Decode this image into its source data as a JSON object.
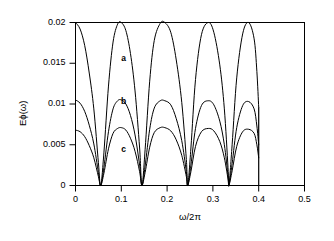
{
  "chart_data": {
    "type": "line",
    "title": "",
    "subtitle": "",
    "xlabel": "ω/2π",
    "ylabel": "Eₖ(ω)",
    "ylabel_text": "Eϕ(ω)",
    "xlim": [
      0,
      0.5
    ],
    "ylim": [
      0,
      0.02
    ],
    "grid": false,
    "legend_position": "inline-annotations",
    "xticks": [
      0,
      0.1,
      0.2,
      0.3,
      0.4,
      0.5
    ],
    "xticklabels": [
      "0",
      "0.1",
      "0.2",
      "0.3",
      "0.4",
      "0.5"
    ],
    "yticks": [
      0,
      0.005,
      0.01,
      0.015,
      0.02
    ],
    "yticklabels": [
      "0",
      "0.005",
      "0.01",
      "0.015",
      "0.02"
    ],
    "zeros": [
      0.055,
      0.145,
      0.245,
      0.335
    ],
    "cutoff_x": 0.4,
    "annotations": [
      {
        "text": "a",
        "x": 0.105,
        "y": 0.0155
      },
      {
        "text": "b",
        "x": 0.105,
        "y": 0.0103
      },
      {
        "text": "c",
        "x": 0.105,
        "y": 0.0043
      }
    ],
    "series": [
      {
        "name": "a",
        "peak_value": 0.02,
        "start_value": 0.02,
        "peaks_x": [
          0.0,
          0.1,
          0.195,
          0.29,
          0.378
        ],
        "peaks_y": [
          0.02,
          0.02,
          0.02,
          0.02,
          0.02
        ],
        "x": [
          0.0,
          0.01,
          0.02,
          0.03,
          0.04,
          0.05,
          0.055,
          0.062,
          0.072,
          0.082,
          0.092,
          0.1,
          0.11,
          0.12,
          0.13,
          0.14,
          0.145,
          0.152,
          0.162,
          0.172,
          0.185,
          0.195,
          0.208,
          0.22,
          0.232,
          0.242,
          0.245,
          0.252,
          0.262,
          0.275,
          0.29,
          0.302,
          0.315,
          0.325,
          0.333,
          0.335,
          0.342,
          0.352,
          0.365,
          0.378,
          0.39,
          0.396,
          0.4
        ],
        "y": [
          0.02,
          0.0192,
          0.0172,
          0.0138,
          0.0094,
          0.0028,
          0.0,
          0.004,
          0.0122,
          0.0176,
          0.0198,
          0.02,
          0.019,
          0.0162,
          0.0116,
          0.0046,
          0.0,
          0.0044,
          0.0128,
          0.0178,
          0.0199,
          0.02,
          0.0188,
          0.0154,
          0.0102,
          0.0032,
          0.0,
          0.0046,
          0.013,
          0.0185,
          0.02,
          0.0188,
          0.0148,
          0.0094,
          0.0022,
          0.0,
          0.005,
          0.0132,
          0.0186,
          0.02,
          0.018,
          0.014,
          0.0096
        ]
      },
      {
        "name": "b",
        "peak_value": 0.0105,
        "start_value": 0.0105,
        "peaks_x": [
          0.0,
          0.1,
          0.195,
          0.29,
          0.378
        ],
        "peaks_y": [
          0.0105,
          0.0105,
          0.0104,
          0.0104,
          0.0103
        ],
        "x": [
          0.0,
          0.01,
          0.02,
          0.03,
          0.04,
          0.05,
          0.055,
          0.062,
          0.072,
          0.082,
          0.092,
          0.1,
          0.11,
          0.12,
          0.13,
          0.14,
          0.145,
          0.152,
          0.162,
          0.172,
          0.185,
          0.195,
          0.208,
          0.22,
          0.232,
          0.242,
          0.245,
          0.252,
          0.262,
          0.275,
          0.29,
          0.302,
          0.315,
          0.325,
          0.333,
          0.335,
          0.342,
          0.352,
          0.365,
          0.378,
          0.39,
          0.396,
          0.4
        ],
        "y": [
          0.0105,
          0.0101,
          0.0091,
          0.0074,
          0.0051,
          0.0016,
          0.0,
          0.0022,
          0.0066,
          0.0094,
          0.0104,
          0.0105,
          0.01,
          0.0086,
          0.0062,
          0.0025,
          0.0,
          0.0024,
          0.0069,
          0.0095,
          0.0104,
          0.0104,
          0.0099,
          0.0082,
          0.0055,
          0.0017,
          0.0,
          0.0025,
          0.007,
          0.0098,
          0.0104,
          0.0099,
          0.0079,
          0.005,
          0.0012,
          0.0,
          0.0027,
          0.0071,
          0.0098,
          0.0103,
          0.0094,
          0.0073,
          0.005
        ]
      },
      {
        "name": "c",
        "peak_value": 0.007,
        "start_value": 0.0068,
        "peaks_x": [
          0.0,
          0.1,
          0.195,
          0.29,
          0.378
        ],
        "peaks_y": [
          0.0068,
          0.0071,
          0.0071,
          0.007,
          0.0069
        ],
        "x": [
          0.0,
          0.01,
          0.02,
          0.03,
          0.04,
          0.05,
          0.055,
          0.062,
          0.072,
          0.082,
          0.092,
          0.1,
          0.11,
          0.12,
          0.13,
          0.14,
          0.145,
          0.152,
          0.162,
          0.172,
          0.185,
          0.195,
          0.208,
          0.22,
          0.232,
          0.242,
          0.245,
          0.252,
          0.262,
          0.275,
          0.29,
          0.302,
          0.315,
          0.325,
          0.333,
          0.335,
          0.342,
          0.352,
          0.365,
          0.378,
          0.39,
          0.396,
          0.4
        ],
        "y": [
          0.0068,
          0.0066,
          0.006,
          0.0049,
          0.0034,
          0.0011,
          0.0,
          0.0015,
          0.0045,
          0.0064,
          0.007,
          0.0071,
          0.0068,
          0.0058,
          0.0042,
          0.0017,
          0.0,
          0.0016,
          0.0047,
          0.0065,
          0.0071,
          0.0071,
          0.0067,
          0.0056,
          0.0037,
          0.0011,
          0.0,
          0.0017,
          0.0048,
          0.0066,
          0.007,
          0.0067,
          0.0054,
          0.0034,
          0.0008,
          0.0,
          0.0018,
          0.0048,
          0.0066,
          0.0069,
          0.0064,
          0.005,
          0.0034
        ]
      }
    ]
  }
}
